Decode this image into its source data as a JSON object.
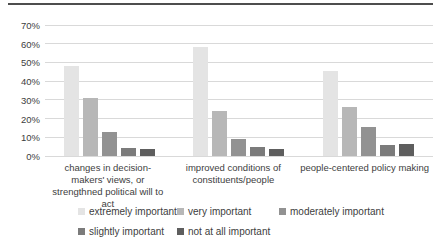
{
  "divider_color": "#4d4d4d",
  "chart_data": {
    "type": "bar",
    "title": "",
    "xlabel": "",
    "ylabel": "",
    "ymax": 70,
    "ymin": 0,
    "ytick_step": 10,
    "ytick_labels": [
      "0%",
      "10%",
      "20%",
      "30%",
      "40%",
      "50%",
      "60%",
      "70%"
    ],
    "grid": true,
    "legend_position": "bottom",
    "categories": [
      "changes in decision-makers' views, or strengthned political will to act",
      "improved conditions of constituents/people",
      "people-centered policy making"
    ],
    "series": [
      {
        "name": "extremely important",
        "color": "#e4e4e4",
        "values": [
          48,
          58,
          45.5
        ]
      },
      {
        "name": "very important",
        "color": "#b7b7b7",
        "values": [
          31,
          24,
          26
        ]
      },
      {
        "name": "moderately important",
        "color": "#929292",
        "values": [
          13,
          9,
          15.5
        ]
      },
      {
        "name": "slightly important",
        "color": "#7b7b7b",
        "values": [
          4.5,
          5,
          6
        ]
      },
      {
        "name": "not at all important",
        "color": "#5e5e5e",
        "values": [
          4,
          3.5,
          6.5
        ]
      }
    ],
    "legend_rows": [
      [
        0,
        1,
        2
      ],
      [
        3,
        4
      ]
    ]
  }
}
